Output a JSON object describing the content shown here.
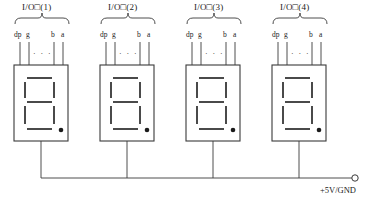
{
  "diagram": {
    "title_prefix": "I/O",
    "modules": [
      {
        "title": "I/O口(1)",
        "title_display": "I/O□(1)",
        "pins": [
          "dp",
          "g",
          "b",
          "a"
        ],
        "ellipsis": "· · ·",
        "decimal_point": true
      },
      {
        "title": "I/O口(2)",
        "title_display": "I/O□(2)",
        "pins": [
          "dp",
          "g",
          "b",
          "a"
        ],
        "ellipsis": "· · ·",
        "decimal_point": true
      },
      {
        "title": "I/O口(3)",
        "title_display": "I/O□(3)",
        "pins": [
          "dp",
          "g",
          "b",
          "a"
        ],
        "ellipsis": "· · ·",
        "decimal_point": true
      },
      {
        "title": "I/O口(4)",
        "title_display": "I/O□(4)",
        "pins": [
          "dp",
          "g",
          "b",
          "a"
        ],
        "ellipsis": "· · ·",
        "decimal_point": true
      }
    ],
    "supply_label": "+5V/GND",
    "caption": "",
    "colors": {
      "line": "#3a3a3a",
      "segment": "#4a4a4a",
      "text": "#222222",
      "background": "#ffffff"
    }
  }
}
